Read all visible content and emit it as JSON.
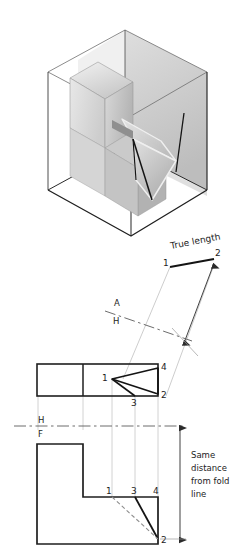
{
  "figure": {
    "title_text": "True length",
    "fold_lines": [
      {
        "id": "ah",
        "upper_label": "A",
        "lower_label": "H"
      },
      {
        "id": "hf",
        "upper_label": "H",
        "lower_label": "F"
      }
    ],
    "note": {
      "line1": "Same",
      "line2": "distance",
      "line3": "from fold",
      "line4": "line"
    },
    "points": {
      "top_view": [
        "1",
        "4",
        "3",
        "2"
      ],
      "front_view": [
        "1",
        "3",
        "4",
        "2"
      ],
      "auxiliary_view": [
        "1",
        "2"
      ]
    },
    "top_view_labels": {
      "p1": "1",
      "p2": "2",
      "p3": "3",
      "p4": "4"
    },
    "front_view_labels": {
      "p1": "1",
      "p2": "2",
      "p3": "3",
      "p4": "4"
    },
    "aux_view_labels": {
      "p1": "1",
      "p2": "2"
    },
    "colors": {
      "line_dark": "#1a1a1a",
      "line_object": "#2b2b2b",
      "projector": "#b9b9b9",
      "fold": "#6e6e6e",
      "hidden": "#8c8c8c",
      "shade_light": "#ededed",
      "shade_mid": "#cfcfcf",
      "shade_dark": "#a8a8a8",
      "glass": "#5a5a5a",
      "text": "#232323"
    }
  }
}
